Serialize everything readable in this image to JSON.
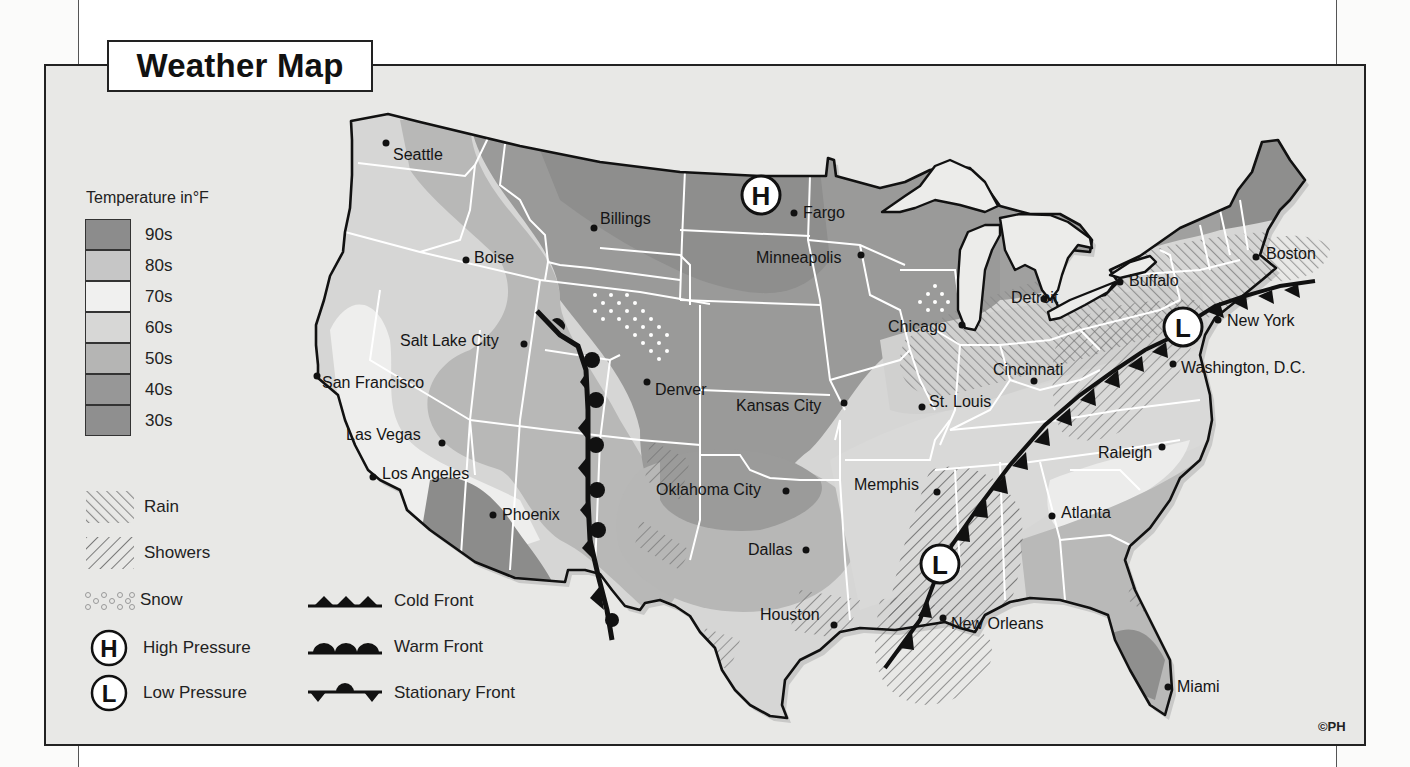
{
  "title": "Weather Map",
  "copyright": "©PH",
  "temperature_legend": {
    "title": "Temperature in°F",
    "bands": [
      {
        "label": "90s",
        "color": "#8c8c8c"
      },
      {
        "label": "80s",
        "color": "#c6c6c6"
      },
      {
        "label": "70s",
        "color": "#f0f0ef"
      },
      {
        "label": "60s",
        "color": "#d7d7d6"
      },
      {
        "label": "50s",
        "color": "#b5b5b4"
      },
      {
        "label": "40s",
        "color": "#979797"
      },
      {
        "label": "30s",
        "color": "#8f8f8f"
      }
    ]
  },
  "precip_legend": [
    {
      "label": "Rain",
      "icon": "rain-hatch-icon"
    },
    {
      "label": "Showers",
      "icon": "showers-hatch-icon"
    },
    {
      "label": "Snow",
      "icon": "snow-dots-icon"
    }
  ],
  "pressure_legend": [
    {
      "symbol": "H",
      "label": "High Pressure",
      "icon": "high-pressure-icon"
    },
    {
      "symbol": "L",
      "label": "Low Pressure",
      "icon": "low-pressure-icon"
    }
  ],
  "front_legend": [
    {
      "label": "Cold Front",
      "icon": "cold-front-icon"
    },
    {
      "label": "Warm Front",
      "icon": "warm-front-icon"
    },
    {
      "label": "Stationary Front",
      "icon": "stationary-front-icon"
    }
  ],
  "cities": [
    {
      "name": "Seattle",
      "x": 393,
      "y": 147,
      "dot_x": 386,
      "dot_y": 143
    },
    {
      "name": "Billings",
      "x": 600,
      "y": 211,
      "dot_x": 594,
      "dot_y": 228
    },
    {
      "name": "Boise",
      "x": 474,
      "y": 250,
      "dot_x": 466,
      "dot_y": 260
    },
    {
      "name": "Fargo",
      "x": 803,
      "y": 205,
      "dot_x": 794,
      "dot_y": 213
    },
    {
      "name": "Minneapolis",
      "x": 756,
      "y": 250,
      "dot_x": 861,
      "dot_y": 255
    },
    {
      "name": "Salt Lake City",
      "x": 400,
      "y": 333,
      "dot_x": 524,
      "dot_y": 344
    },
    {
      "name": "San Francisco",
      "x": 320,
      "y": 375,
      "dot_x": 317,
      "dot_y": 376
    },
    {
      "name": "Denver",
      "x": 655,
      "y": 382,
      "dot_x": 647,
      "dot_y": 382
    },
    {
      "name": "Kansas City",
      "x": 736,
      "y": 398,
      "dot_x": 844,
      "dot_y": 403
    },
    {
      "name": "St. Louis",
      "x": 929,
      "y": 394,
      "dot_x": 922,
      "dot_y": 407
    },
    {
      "name": "Chicago",
      "x": 888,
      "y": 319,
      "dot_x": 962,
      "dot_y": 325
    },
    {
      "name": "Detroit",
      "x": 1011,
      "y": 290,
      "dot_x": 1044,
      "dot_y": 299
    },
    {
      "name": "Buffalo",
      "x": 1129,
      "y": 273,
      "dot_x": 1120,
      "dot_y": 282
    },
    {
      "name": "Boston",
      "x": 1266,
      "y": 246,
      "dot_x": 1256,
      "dot_y": 257
    },
    {
      "name": "New York",
      "x": 1227,
      "y": 313,
      "dot_x": 1218,
      "dot_y": 320
    },
    {
      "name": "Washington, D.C.",
      "x": 1181,
      "y": 360,
      "dot_x": 1173,
      "dot_y": 364
    },
    {
      "name": "Cincinnati",
      "x": 993,
      "y": 362,
      "dot_x": 1034,
      "dot_y": 381
    },
    {
      "name": "Las Vegas",
      "x": 346,
      "y": 427,
      "dot_x": 442,
      "dot_y": 443
    },
    {
      "name": "Los Angeles",
      "x": 382,
      "y": 466,
      "dot_x": 373,
      "dot_y": 477
    },
    {
      "name": "Phoenix",
      "x": 502,
      "y": 507,
      "dot_x": 493,
      "dot_y": 515
    },
    {
      "name": "Oklahoma City",
      "x": 656,
      "y": 482,
      "dot_x": 786,
      "dot_y": 491
    },
    {
      "name": "Memphis",
      "x": 854,
      "y": 477,
      "dot_x": 937,
      "dot_y": 492
    },
    {
      "name": "Raleigh",
      "x": 1098,
      "y": 445,
      "dot_x": 1162,
      "dot_y": 447
    },
    {
      "name": "Atlanta",
      "x": 1061,
      "y": 505,
      "dot_x": 1052,
      "dot_y": 516
    },
    {
      "name": "Dallas",
      "x": 748,
      "y": 542,
      "dot_x": 806,
      "dot_y": 550
    },
    {
      "name": "Houston",
      "x": 760,
      "y": 607,
      "dot_x": 834,
      "dot_y": 625
    },
    {
      "name": "New Orleans",
      "x": 951,
      "y": 616,
      "dot_x": 943,
      "dot_y": 618
    },
    {
      "name": "Miami",
      "x": 1177,
      "y": 679,
      "dot_x": 1168,
      "dot_y": 687
    }
  ],
  "pressure_systems": [
    {
      "type": "H",
      "x": 761,
      "y": 195
    },
    {
      "type": "L",
      "x": 1183,
      "y": 327
    },
    {
      "type": "L",
      "x": 940,
      "y": 564
    }
  ]
}
